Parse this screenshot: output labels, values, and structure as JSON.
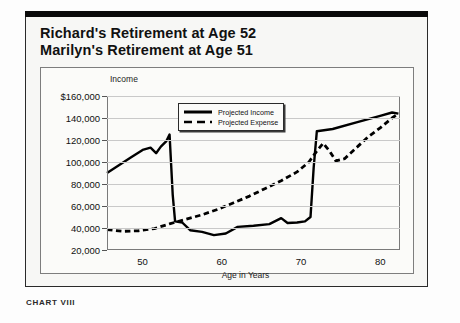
{
  "card": {
    "title_line1": "Richard's Retirement at Age 52",
    "title_line2": "Marilyn's Retirement at Age 51"
  },
  "caption": "CHART VIII",
  "legend": {
    "position": "inside-top-center",
    "items": [
      {
        "label": "Projected Income",
        "style": "solid",
        "color": "#000000"
      },
      {
        "label": "Projected Expense",
        "style": "dashed",
        "color": "#000000"
      }
    ]
  },
  "chart_data": {
    "type": "line",
    "xlabel": "Age in Years",
    "ylabel": "Income",
    "xlim": [
      45.5,
      82.5
    ],
    "ylim": [
      20000,
      160000
    ],
    "grid": true,
    "xticks": [
      50,
      60,
      70,
      80
    ],
    "xtick_labels": [
      "50",
      "60",
      "70",
      "80"
    ],
    "yticks": [
      20000,
      40000,
      60000,
      80000,
      100000,
      120000,
      140000,
      160000
    ],
    "ytick_labels": [
      "20,000",
      "40,000",
      "60,000",
      "80,000",
      "100,000",
      "120,000",
      "140,000",
      "$160,000"
    ],
    "series": [
      {
        "name": "Projected Income",
        "style": "solid",
        "color": "#000000",
        "points": [
          [
            45.5,
            90000
          ],
          [
            47.0,
            97000
          ],
          [
            48.5,
            104000
          ],
          [
            50.0,
            111000
          ],
          [
            51.0,
            113000
          ],
          [
            51.7,
            108000
          ],
          [
            52.3,
            114000
          ],
          [
            53.0,
            119000
          ],
          [
            53.4,
            125000
          ],
          [
            53.8,
            70000
          ],
          [
            54.1,
            46000
          ],
          [
            55.0,
            45000
          ],
          [
            56.0,
            38000
          ],
          [
            57.5,
            36500
          ],
          [
            59.0,
            33500
          ],
          [
            60.5,
            35000
          ],
          [
            62.0,
            41000
          ],
          [
            64.0,
            42000
          ],
          [
            66.0,
            43500
          ],
          [
            67.5,
            49000
          ],
          [
            68.3,
            44500
          ],
          [
            69.5,
            45000
          ],
          [
            70.5,
            46000
          ],
          [
            71.2,
            50000
          ],
          [
            71.6,
            95000
          ],
          [
            72.0,
            128000
          ],
          [
            74.0,
            130000
          ],
          [
            77.0,
            136000
          ],
          [
            80.0,
            142000
          ],
          [
            81.5,
            145000
          ],
          [
            82.3,
            144000
          ]
        ]
      },
      {
        "name": "Projected Expense",
        "style": "dashed",
        "color": "#000000",
        "points": [
          [
            45.5,
            38500
          ],
          [
            47.5,
            37000
          ],
          [
            49.5,
            37500
          ],
          [
            51.5,
            39500
          ],
          [
            53.5,
            44000
          ],
          [
            55.5,
            48000
          ],
          [
            57.5,
            52000
          ],
          [
            59.5,
            57000
          ],
          [
            61.5,
            63000
          ],
          [
            63.5,
            69000
          ],
          [
            65.5,
            76000
          ],
          [
            67.5,
            83000
          ],
          [
            69.5,
            91000
          ],
          [
            71.0,
            100000
          ],
          [
            72.0,
            110000
          ],
          [
            72.8,
            117000
          ],
          [
            73.6,
            110000
          ],
          [
            74.4,
            101000
          ],
          [
            75.5,
            103000
          ],
          [
            77.0,
            113000
          ],
          [
            78.5,
            123000
          ],
          [
            80.0,
            131000
          ],
          [
            81.5,
            140000
          ],
          [
            82.3,
            144000
          ]
        ]
      }
    ]
  }
}
